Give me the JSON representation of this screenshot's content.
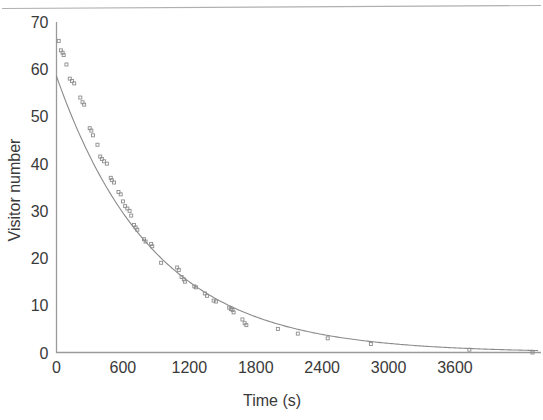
{
  "figure": {
    "background_color": "#ffffff",
    "ink_color": "#3a3a3a",
    "line_color": "#8a8a8a",
    "top_rule_visible": true
  },
  "chart_data": {
    "type": "scatter",
    "title": "",
    "subtitle": "",
    "xlabel": "Time (s)",
    "ylabel": "Visitor number",
    "xlim": [
      0,
      4350
    ],
    "ylim": [
      0,
      70
    ],
    "xticks": [
      0,
      600,
      1200,
      1800,
      2400,
      3000,
      3600
    ],
    "xtick_labels": [
      "0",
      "600",
      "1200",
      "1800",
      "2400",
      "3000",
      "3600"
    ],
    "yticks": [
      0,
      10,
      20,
      30,
      40,
      50,
      60,
      70
    ],
    "ytick_labels": [
      "0",
      "10",
      "20",
      "30",
      "40",
      "50",
      "60",
      "70"
    ],
    "grid": false,
    "legend": null,
    "annotations": [],
    "marker_style": "open-square",
    "marker_size": 3,
    "series": [
      {
        "name": "Visitor number (observed)",
        "type": "scatter",
        "marker": "open-square",
        "points": [
          [
            20,
            66.0
          ],
          [
            40,
            64.0
          ],
          [
            55,
            63.5
          ],
          [
            65,
            63.0
          ],
          [
            90,
            61.0
          ],
          [
            120,
            58.0
          ],
          [
            140,
            57.5
          ],
          [
            160,
            57.0
          ],
          [
            215,
            54.0
          ],
          [
            235,
            53.0
          ],
          [
            250,
            52.5
          ],
          [
            300,
            47.5
          ],
          [
            315,
            47.0
          ],
          [
            330,
            46.0
          ],
          [
            370,
            44.0
          ],
          [
            395,
            41.5
          ],
          [
            410,
            41.0
          ],
          [
            430,
            40.5
          ],
          [
            455,
            40.0
          ],
          [
            490,
            37.0
          ],
          [
            500,
            36.5
          ],
          [
            520,
            36.0
          ],
          [
            560,
            34.0
          ],
          [
            580,
            33.5
          ],
          [
            600,
            32.0
          ],
          [
            620,
            31.0
          ],
          [
            640,
            30.5
          ],
          [
            660,
            30.0
          ],
          [
            675,
            29.0
          ],
          [
            700,
            27.0
          ],
          [
            715,
            26.5
          ],
          [
            730,
            26.0
          ],
          [
            790,
            24.0
          ],
          [
            805,
            23.5
          ],
          [
            855,
            23.0
          ],
          [
            865,
            22.5
          ],
          [
            945,
            19.0
          ],
          [
            1090,
            18.0
          ],
          [
            1105,
            17.5
          ],
          [
            1130,
            16.0
          ],
          [
            1150,
            15.5
          ],
          [
            1160,
            15.0
          ],
          [
            1245,
            14.0
          ],
          [
            1260,
            13.8
          ],
          [
            1340,
            12.5
          ],
          [
            1360,
            12.0
          ],
          [
            1420,
            11.0
          ],
          [
            1440,
            10.8
          ],
          [
            1560,
            9.5
          ],
          [
            1575,
            9.2
          ],
          [
            1590,
            9.0
          ],
          [
            1600,
            8.5
          ],
          [
            1680,
            7.0
          ],
          [
            1700,
            6.2
          ],
          [
            1715,
            5.8
          ],
          [
            2000,
            5.0
          ],
          [
            2180,
            4.0
          ],
          [
            2450,
            3.0
          ],
          [
            2840,
            1.8
          ],
          [
            3730,
            0.6
          ],
          [
            4300,
            0.0
          ]
        ]
      },
      {
        "name": "Exponential fit",
        "type": "line",
        "model": "exponential-decay",
        "amplitude": 58.5,
        "tau": 880,
        "offset": 0.0,
        "description": "Fitted decay curve through scatter points"
      }
    ]
  },
  "axis_labels": {
    "x_title": "Time (s)",
    "y_title": "Visitor number"
  }
}
